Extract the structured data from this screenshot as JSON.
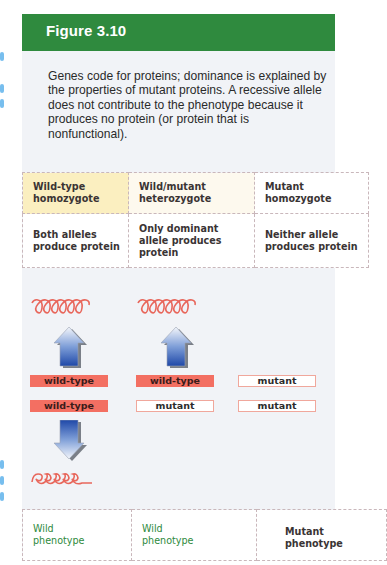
{
  "figure": {
    "title": "Figure 3.10",
    "caption": "Genes code for proteins; dominance is explained by the properties of mutant proteins. A recessive allele does not contribute to the phenotype because it produces no protein (or protein that is nonfunctional).",
    "colors": {
      "header_green": "#2f8a3e",
      "panel_bg": "#f1f3f7",
      "wild_type_red": "#f36f62",
      "mutant_border": "#f0a79c",
      "protein_coil": "#e8675c",
      "arrow_blue": "#2f5fb8",
      "phenotype_green": "#2e8a3c",
      "homozygote_yellow": "#fbefc0"
    }
  },
  "genotype_table": {
    "headers": [
      {
        "line1": "Wild-type",
        "line2": "homozygote"
      },
      {
        "line1": "Wild/mutant",
        "line2": "heterozygote"
      },
      {
        "line1": "Mutant",
        "line2": "homozygote"
      }
    ],
    "descriptions": [
      {
        "line1": "Both alleles",
        "line2": "produce protein",
        "line3": ""
      },
      {
        "line1": "Only dominant",
        "line2": "allele produces",
        "line3": "protein"
      },
      {
        "line1": "Neither allele",
        "line2": "produces protein",
        "line3": ""
      }
    ]
  },
  "diagram": {
    "columns": [
      {
        "protein_icon": "protein-coil-icon",
        "arrow_icon": "arrow-up-icon",
        "allele1": "wild-type",
        "allele2": "wild-type"
      },
      {
        "protein_icon": "protein-coil-icon",
        "arrow_icon": "arrow-up-icon",
        "allele1": "wild-type",
        "allele2": "mutant"
      },
      {
        "allele1": "mutant",
        "allele2": "mutant"
      }
    ],
    "bottom_arrow_icon": "arrow-down-icon",
    "bottom_protein_icon": "protein-coil-icon"
  },
  "phenotype_table": {
    "cells": [
      {
        "line1": "Wild",
        "line2": "phenotype"
      },
      {
        "line1": "Wild",
        "line2": "phenotype"
      },
      {
        "line1": "Mutant",
        "line2": "phenotype"
      }
    ]
  }
}
